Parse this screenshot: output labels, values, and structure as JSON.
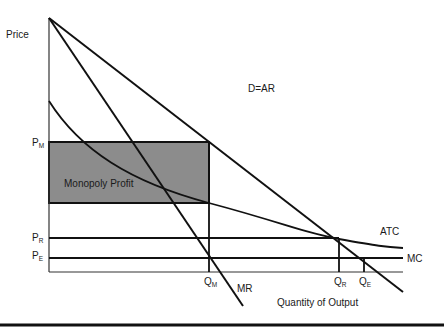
{
  "diagram": {
    "type": "monopoly-profit-diagram",
    "y_axis_label": "Price",
    "x_axis_label": "Quantity of Output",
    "curves": {
      "demand": {
        "label": "D=AR"
      },
      "marginal_revenue": {
        "label": "MR"
      },
      "average_total_cost": {
        "label": "ATC"
      },
      "marginal_cost": {
        "label": "MC"
      }
    },
    "shaded_region": {
      "label": "Monopoly Profit",
      "fill": "#8c8c8c"
    },
    "price_levels": [
      {
        "main": "P",
        "sub": "M"
      },
      {
        "main": "P",
        "sub": "R"
      },
      {
        "main": "P",
        "sub": "E"
      }
    ],
    "quantity_levels": [
      {
        "main": "Q",
        "sub": "M"
      },
      {
        "main": "Q",
        "sub": "R"
      },
      {
        "main": "Q",
        "sub": "E"
      }
    ]
  }
}
